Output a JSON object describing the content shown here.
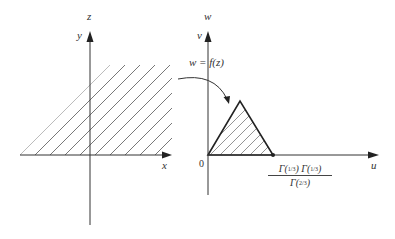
{
  "figure": {
    "left_plane": {
      "plane_label": "z",
      "vertical_axis_label": "y",
      "horizontal_axis_label": "x",
      "region": "upper half-plane (hatched)"
    },
    "mapping": {
      "label": "w = f(z)"
    },
    "right_plane": {
      "plane_label": "w",
      "vertical_axis_label": "v",
      "horizontal_axis_label": "u",
      "origin_label": "0",
      "region": "equilateral triangle (hatched)",
      "vertex_label": {
        "numerator": "Γ(⅓) Γ(⅓)",
        "numerator_left": "Γ(",
        "numerator_frac1": "1/3",
        "numerator_mid": ") Γ(",
        "numerator_frac2": "1/3",
        "numerator_right": ")",
        "denominator_left": "Γ(",
        "denominator_frac": "2/3",
        "denominator_right": ")"
      }
    },
    "colors": {
      "line": "#333333",
      "hatch": "#555555",
      "background": "#ffffff"
    }
  }
}
